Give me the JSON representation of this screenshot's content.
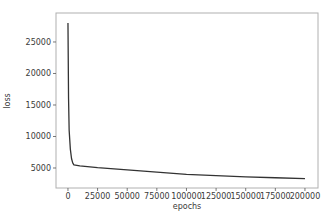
{
  "chart_data": {
    "type": "line",
    "title": "",
    "xlabel": "epochs",
    "ylabel": "loss",
    "xlim": [
      -10100,
      211000
    ],
    "ylim": [
      1825,
      29600
    ],
    "grid": false,
    "legend": null,
    "xticks": [
      0,
      25000,
      50000,
      75000,
      100000,
      125000,
      150000,
      175000,
      200000
    ],
    "xtick_labels": [
      "0",
      "25000",
      "50000",
      "75000",
      "100000",
      "125000",
      "150000",
      "175000",
      "200000"
    ],
    "yticks": [
      5000,
      10000,
      15000,
      20000,
      25000
    ],
    "ytick_labels": [
      "5000",
      "10000",
      "15000",
      "20000",
      "25000"
    ],
    "series": [
      {
        "name": "loss",
        "color": "#333333",
        "x": [
          0,
          500,
          1000,
          2000,
          3000,
          4000,
          5000,
          10000,
          25000,
          50000,
          75000,
          100000,
          125000,
          150000,
          175000,
          200000
        ],
        "y": [
          28000,
          16000,
          11000,
          8000,
          6500,
          5800,
          5500,
          5350,
          5050,
          4700,
          4350,
          4000,
          3800,
          3600,
          3450,
          3300
        ]
      }
    ]
  },
  "plot": {
    "frame_color": "#b0b0b0",
    "text_color": "#3a3a3a"
  }
}
